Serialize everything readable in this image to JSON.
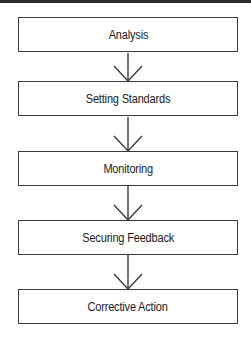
{
  "diagram": {
    "type": "flowchart",
    "direction": "top-to-bottom",
    "steps": [
      {
        "label": "Analysis"
      },
      {
        "label": "Setting Standards"
      },
      {
        "label": "Monitoring"
      },
      {
        "label": "Securing Feedback"
      },
      {
        "label": "Corrective Action"
      }
    ],
    "connectors": [
      {
        "from": 0,
        "to": 1
      },
      {
        "from": 1,
        "to": 2
      },
      {
        "from": 2,
        "to": 3
      },
      {
        "from": 3,
        "to": 4
      }
    ],
    "colors": {
      "line": "#3a3a3a",
      "text": "#1a1a1a",
      "background": "#ffffff"
    }
  }
}
